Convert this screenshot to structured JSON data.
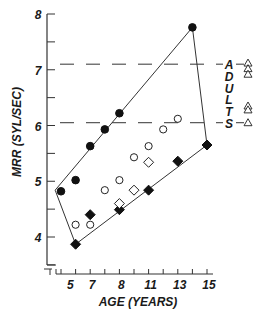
{
  "chart_data": {
    "type": "scatter",
    "title": "",
    "xlabel": "AGE (YEARS)",
    "ylabel": "MRR (SYL/SEC)",
    "x_axis": {
      "range": [
        0,
        10.5
      ],
      "tick_positions": [
        0,
        1,
        2,
        3,
        4,
        5,
        6,
        7,
        8,
        9,
        10
      ],
      "tick_labels": [
        {
          "pos": 0.5,
          "text": "5"
        },
        {
          "pos": 2,
          "text": "7"
        },
        {
          "pos": 4,
          "text": "8"
        },
        {
          "pos": 6,
          "text": "11"
        },
        {
          "pos": 8,
          "text": "13"
        },
        {
          "pos": 10,
          "text": "15"
        }
      ]
    },
    "y_axis": {
      "range": [
        3.5,
        8
      ],
      "ticks": [
        8,
        7.5,
        7,
        6.5,
        6,
        5.5,
        5,
        4.5,
        4,
        3.5
      ],
      "tick_labels": [
        "8",
        "7",
        "6",
        "5",
        "4"
      ]
    },
    "series": [
      {
        "name": "filled-circles",
        "marker": "circle-filled",
        "points": [
          [
            0,
            4.82
          ],
          [
            1,
            5.02
          ],
          [
            2,
            5.63
          ],
          [
            3,
            5.93
          ],
          [
            4,
            6.22
          ],
          [
            9,
            7.76
          ]
        ]
      },
      {
        "name": "open-circles",
        "marker": "circle-open",
        "points": [
          [
            1,
            4.22
          ],
          [
            2,
            4.22
          ],
          [
            3,
            4.84
          ],
          [
            4,
            5.02
          ],
          [
            5,
            5.43
          ],
          [
            6,
            5.63
          ],
          [
            7,
            5.93
          ],
          [
            8,
            6.12
          ]
        ]
      },
      {
        "name": "filled-diamonds",
        "marker": "diamond-filled",
        "points": [
          [
            1,
            3.87
          ],
          [
            2,
            4.4
          ],
          [
            4,
            4.49
          ],
          [
            6,
            4.84
          ],
          [
            8,
            5.36
          ],
          [
            10,
            5.65
          ]
        ]
      },
      {
        "name": "open-diamonds",
        "marker": "diamond-open",
        "points": [
          [
            4,
            4.6
          ],
          [
            5,
            4.84
          ],
          [
            6,
            5.34
          ]
        ]
      }
    ],
    "envelope_polygon": [
      [
        -0.4,
        4.84
      ],
      [
        9,
        7.76
      ],
      [
        10,
        5.65
      ],
      [
        1,
        3.87
      ]
    ],
    "adult_reference": {
      "label_letters": [
        "A",
        "D",
        "U",
        "L",
        "T",
        "S"
      ],
      "dashed_lines_y": [
        7.1,
        6.05
      ],
      "triangles_y": [
        7.12,
        7.02,
        6.92,
        6.35,
        6.28,
        6.05
      ]
    },
    "grid": false,
    "legend": "none"
  }
}
